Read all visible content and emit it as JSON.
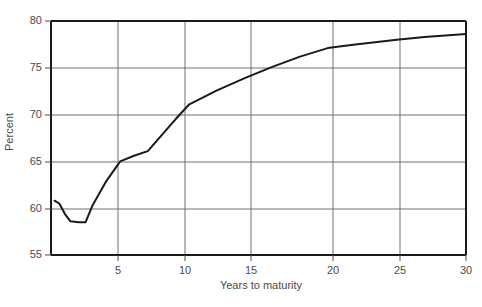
{
  "chart_data": {
    "type": "line",
    "title": "",
    "xlabel": "Years to maturity",
    "ylabel": "Percent",
    "xlim": [
      0,
      30
    ],
    "ylim": [
      55,
      80
    ],
    "xticks": [
      5,
      10,
      15,
      20,
      25,
      30
    ],
    "yticks": [
      55,
      60,
      65,
      70,
      75,
      80
    ],
    "grid": true,
    "legend": "none",
    "series": [
      {
        "name": "Percent",
        "color": "#1a1a1a",
        "x": [
          0.25,
          0.6,
          1.0,
          1.4,
          2.0,
          2.5,
          3.0,
          4.0,
          5.0,
          6.0,
          7.0,
          8.0,
          9.0,
          10.0,
          12.0,
          14.0,
          16.0,
          18.0,
          20.0,
          22.0,
          25.0,
          27.0,
          30.0
        ],
        "y": [
          60.8,
          60.5,
          59.4,
          58.6,
          58.5,
          58.5,
          60.3,
          62.9,
          65.0,
          65.6,
          66.1,
          67.8,
          69.5,
          71.1,
          72.6,
          73.9,
          75.1,
          76.2,
          77.1,
          77.5,
          78.0,
          78.3,
          78.6
        ]
      }
    ]
  },
  "axes": {
    "y_tick_labels": [
      "80",
      "75",
      "70",
      "65",
      "60",
      "55"
    ],
    "x_tick_labels": [
      "5",
      "10",
      "15",
      "20",
      "25",
      "30"
    ],
    "y_title": "Percent",
    "x_title": "Years to maturity"
  },
  "colors": {
    "line": "#1a1a1a",
    "grid": "#6e6e78",
    "axis": "#1a1a1a",
    "background": "#ffffff",
    "tick_text": "#4a4a4a"
  }
}
